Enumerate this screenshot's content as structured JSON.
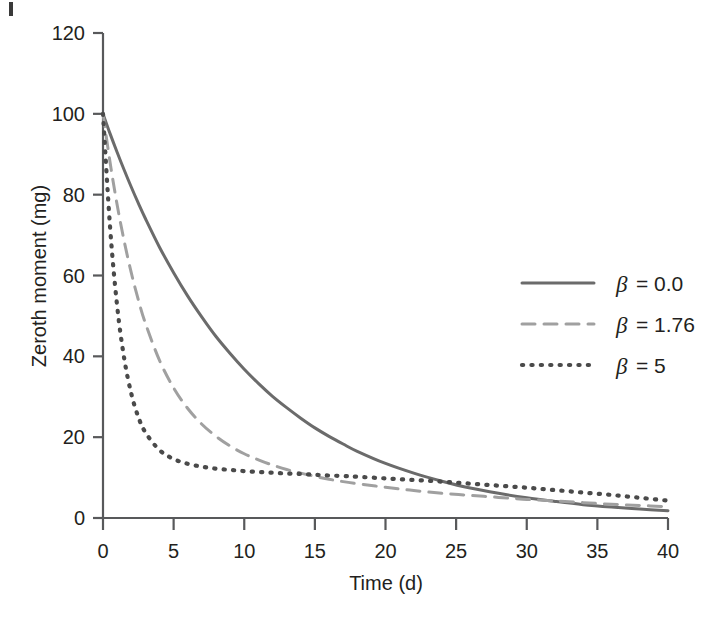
{
  "chart_data": {
    "type": "line",
    "title": "",
    "xlabel": "Time (d)",
    "ylabel": "Zeroth moment (mg)",
    "xlim": [
      0,
      40
    ],
    "ylim": [
      0,
      120
    ],
    "xticks": [
      0,
      5,
      10,
      15,
      20,
      25,
      30,
      35,
      40
    ],
    "yticks": [
      0,
      20,
      40,
      60,
      80,
      100,
      120
    ],
    "grid": false,
    "legend_position": "upper-right",
    "x": [
      0,
      0.5,
      1,
      1.5,
      2,
      2.5,
      3,
      4,
      5,
      6,
      7,
      8,
      9,
      10,
      11,
      12,
      13,
      14,
      15,
      16,
      17,
      18,
      20,
      22,
      24,
      26,
      28,
      30,
      32,
      34,
      36,
      38,
      40
    ],
    "series": [
      {
        "name": "β = 0.0",
        "label": "β = 0.0",
        "style": "solid",
        "color": "#6b6b6b",
        "values": [
          100,
          95.1,
          90.5,
          86.1,
          81.9,
          77.9,
          74.1,
          67.0,
          60.7,
          54.9,
          49.7,
          44.9,
          40.7,
          36.8,
          33.3,
          30.1,
          27.3,
          24.7,
          22.3,
          20.2,
          18.3,
          16.5,
          13.5,
          11.1,
          9.1,
          7.4,
          6.1,
          5.0,
          4.1,
          3.3,
          2.7,
          2.2,
          1.8
        ]
      },
      {
        "name": "β = 1.76",
        "label": "β = 1.76",
        "style": "dashed",
        "color": "#a0a0a0",
        "values": [
          100,
          88.0,
          77.5,
          68.5,
          60.7,
          54.0,
          48.2,
          39.0,
          32.2,
          27.1,
          23.2,
          20.2,
          17.8,
          15.9,
          14.4,
          13.1,
          12.0,
          11.1,
          10.3,
          9.6,
          9.0,
          8.5,
          7.6,
          6.8,
          6.1,
          5.6,
          5.1,
          4.6,
          4.2,
          3.8,
          3.4,
          3.1,
          2.8
        ]
      },
      {
        "name": "β = 5",
        "label": "β = 5",
        "style": "dotted",
        "color": "#4a4a4a",
        "values": [
          100,
          72.0,
          52.5,
          39.5,
          30.8,
          25.0,
          21.2,
          16.8,
          14.6,
          13.4,
          12.7,
          12.2,
          11.9,
          11.6,
          11.4,
          11.2,
          11.0,
          10.9,
          10.7,
          10.5,
          10.4,
          10.2,
          9.8,
          9.4,
          9.0,
          8.5,
          8.0,
          7.5,
          6.9,
          6.3,
          5.7,
          5.0,
          4.3
        ]
      }
    ],
    "annotations": []
  },
  "axes": {
    "ylabel": "Zeroth moment (mg)",
    "xlabel": "Time (d)",
    "ytick_labels": [
      "0",
      "20",
      "40",
      "60",
      "80",
      "100",
      "120"
    ],
    "xtick_labels": [
      "0",
      "5",
      "10",
      "15",
      "20",
      "25",
      "30",
      "35",
      "40"
    ]
  },
  "legend": {
    "entries": [
      {
        "label": "β = 0.0",
        "symbol": "β",
        "value": "= 0.0",
        "style": "solid"
      },
      {
        "label": "β = 1.76",
        "symbol": "β",
        "value": "= 1.76",
        "style": "dashed"
      },
      {
        "label": "β = 5",
        "symbol": "β",
        "value": "= 5",
        "style": "dotted"
      }
    ]
  },
  "colors": {
    "solid": "#6b6b6b",
    "dashed": "#a0a0a0",
    "dotted": "#4a4a4a",
    "axis": "#58595b",
    "text": "#231f20",
    "background": "#ffffff"
  }
}
